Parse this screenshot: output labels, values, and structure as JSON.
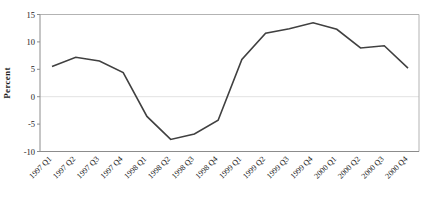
{
  "chart_data": {
    "type": "line",
    "title": "",
    "ylabel": "Percent",
    "xlabel": "",
    "categories": [
      "1997 Q1",
      "1997 Q2",
      "1997 Q3",
      "1997 Q4",
      "1998 Q1",
      "1998 Q2",
      "1998 Q3",
      "1998 Q4",
      "1999 Q1",
      "1999 Q2",
      "1999 Q3",
      "1999 Q4",
      "2000 Q1",
      "2000 Q2",
      "2000 Q3",
      "2000 Q4"
    ],
    "values": [
      5.5,
      7.2,
      6.5,
      4.4,
      -3.6,
      -7.8,
      -6.8,
      -4.3,
      6.8,
      11.6,
      12.4,
      13.5,
      12.3,
      8.9,
      9.3,
      5.2
    ],
    "ylim": [
      -10,
      15
    ],
    "yticks": [
      15,
      10,
      5,
      0,
      -5,
      -10
    ],
    "grid": "zero-line-only",
    "legend": "none",
    "colors": {
      "line": "#404040",
      "axis": "#8c8c8c",
      "frame": "#b3b3b3",
      "zero_gridline": "#e2e2e2",
      "text": "#1a1a1a",
      "background": "#ffffff"
    }
  }
}
